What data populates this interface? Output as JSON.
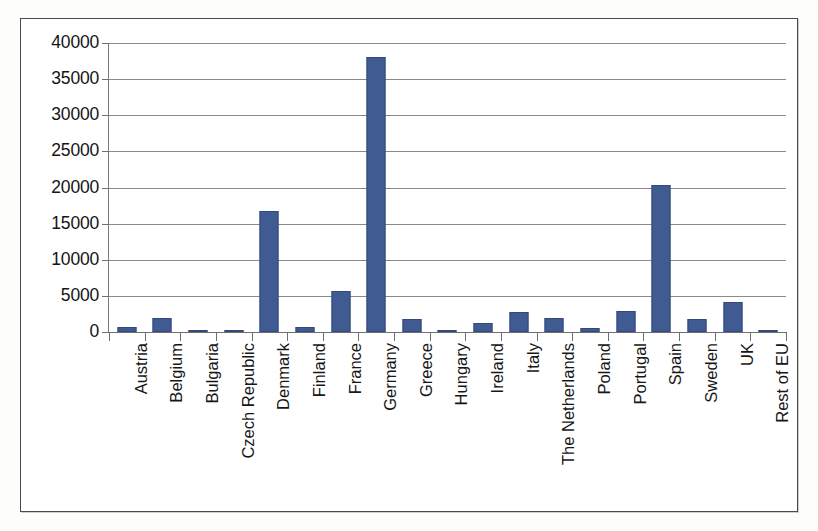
{
  "chart_data": {
    "type": "bar",
    "title": "",
    "subtitle": "",
    "xlabel": "",
    "ylabel": "",
    "ylim": [
      0,
      40000
    ],
    "ytick_step": 5000,
    "ytick_labels": [
      "40000",
      "35000",
      "30000",
      "25000",
      "20000",
      "15000",
      "10000",
      "5000",
      "0"
    ],
    "ytick_values": [
      40000,
      35000,
      30000,
      25000,
      20000,
      15000,
      10000,
      5000,
      0
    ],
    "grid": "horizontal",
    "legend": "none",
    "bar_color": "#3f5b92",
    "categories": [
      "Austria",
      "Belgium",
      "Bulgaria",
      "Czech Republic",
      "Denmark",
      "Finland",
      "France",
      "Germany",
      "Greece",
      "Hungary",
      "Ireland",
      "Italy",
      "The Netherlands",
      "Poland",
      "Portugal",
      "Spain",
      "Sweden",
      "UK",
      "Rest of EU"
    ],
    "values": [
      700,
      2000,
      150,
      150,
      16800,
      650,
      5700,
      38000,
      1750,
      100,
      1300,
      2800,
      1900,
      600,
      2900,
      20300,
      1800,
      4200,
      200
    ]
  }
}
